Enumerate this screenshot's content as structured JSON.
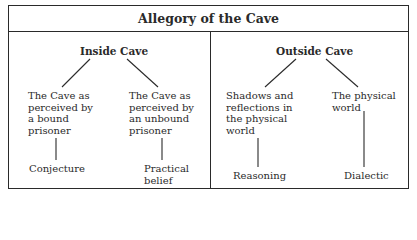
{
  "title": "Allegory of the Cave",
  "sections": [
    {
      "heading": "Inside Cave",
      "branches": [
        {
          "label": "The Cave as\nperceived by\na bound\nprisoner",
          "result": "Conjecture"
        },
        {
          "label": "The Cave as\nperceived by\nan unbound\nprisoner",
          "result": "Practical\nbelief"
        }
      ]
    },
    {
      "heading": "Outside Cave",
      "branches": [
        {
          "label": "Shadows and\nreflections in\nthe physical\nworld",
          "result": "Reasoning"
        },
        {
          "label": "The physical\nworld",
          "result": "Dialectic"
        }
      ]
    }
  ],
  "colors": {
    "line": "#2a2a2a",
    "background": "#ffffff"
  }
}
